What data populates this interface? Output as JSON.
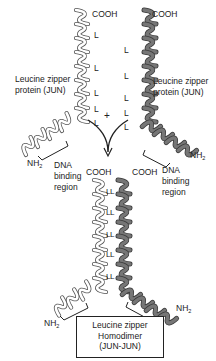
{
  "diagram": {
    "type": "leucine zipper dimerization schematic",
    "colors": {
      "left_helix": "#ffffff",
      "left_helix_stroke": "#555555",
      "right_helix": "#6e6e6e",
      "right_helix_stroke": "#3a3a3a",
      "text": "#222222"
    },
    "top_left_monomer": {
      "cooh_label": "COOH",
      "name_label_line1": "Leucine zipper",
      "name_label_line2": "protein (JUN)",
      "leucine_marks": [
        "L",
        "L",
        "L",
        "L",
        "L"
      ],
      "nh2_label": "NH",
      "nh2_sub": "2",
      "dna_label_line1": "DNA",
      "dna_label_line2": "binding",
      "dna_label_line3": "region"
    },
    "top_right_monomer": {
      "cooh_label": "COOH",
      "name_label_line1": "Leucine zipper",
      "name_label_line2": "protein (JUN)",
      "leucine_marks": [
        "L",
        "L",
        "L",
        "L",
        "L"
      ],
      "nh2_label": "NH",
      "nh2_sub": "2",
      "dna_label_line1": "DNA",
      "dna_label_line2": "binding",
      "dna_label_line3": "region"
    },
    "combine_symbol": "+",
    "dimer": {
      "cooh_left": "COOH",
      "cooh_right": "COOH",
      "leucine_pairs": [
        "LL",
        "LL",
        "LL",
        "LL",
        "LL"
      ],
      "nh2_left": "NH",
      "nh2_left_sub": "2",
      "nh2_right": "NH",
      "nh2_right_sub": "2",
      "box_line1": "Leucine zipper",
      "box_line2": "Homodimer",
      "box_line3": "(JUN-JUN)"
    }
  }
}
